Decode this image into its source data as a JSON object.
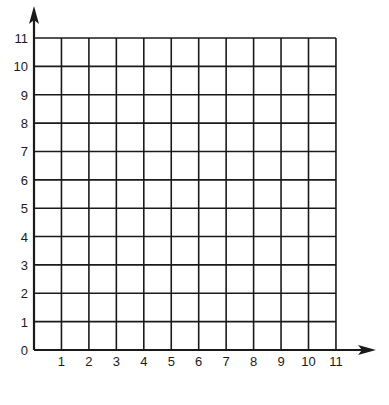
{
  "chart_data": {
    "type": "scatter",
    "title": "",
    "xlabel": "",
    "ylabel": "",
    "xlim": [
      0,
      11
    ],
    "ylim": [
      0,
      11
    ],
    "grid": true,
    "legend": null,
    "x_ticks": [
      "1",
      "2",
      "3",
      "4",
      "5",
      "6",
      "7",
      "8",
      "9",
      "10",
      "11"
    ],
    "y_ticks": [
      "0",
      "1",
      "2",
      "3",
      "4",
      "5",
      "6",
      "7",
      "8",
      "9",
      "10",
      "11"
    ],
    "series": []
  },
  "style": {
    "line_color": "#1a1a1a",
    "text_color": "#1a1a1a",
    "background": "#ffffff"
  },
  "layout": {
    "origin_x": 34,
    "origin_y": 350,
    "cell_w": 27.45,
    "cell_h": 28.36,
    "x_arrow_end": 376,
    "y_arrow_end": 6
  }
}
